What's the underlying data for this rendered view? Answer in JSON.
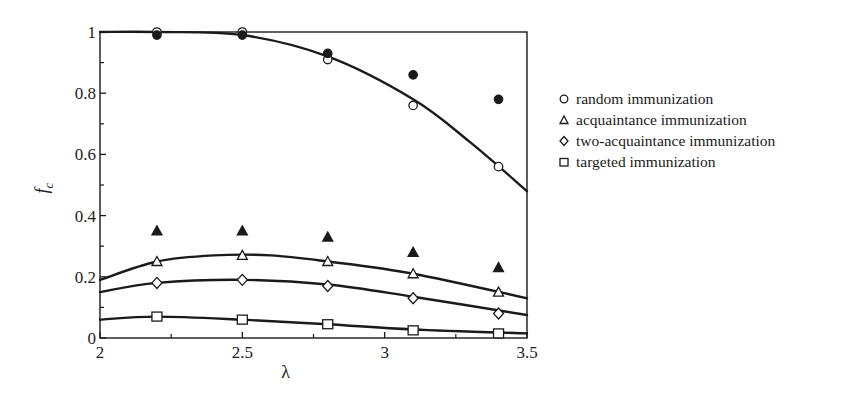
{
  "chart_data": {
    "type": "scatter",
    "title": "",
    "xlabel": "λ",
    "ylabel": "f_c",
    "xlim": [
      2,
      3.5
    ],
    "ylim": [
      0,
      1
    ],
    "x_ticks": [
      2,
      2.5,
      3,
      3.5
    ],
    "x_tick_labels": [
      "2",
      "2.5",
      "3",
      "3.5"
    ],
    "y_ticks": [
      0,
      0.2,
      0.4,
      0.6,
      0.8,
      1
    ],
    "y_tick_labels": [
      "0",
      "0.2",
      "0.4",
      "0.6",
      "0.8",
      "1"
    ],
    "grid": false,
    "legend_position": "right-outside",
    "x": [
      2.2,
      2.5,
      2.8,
      3.1,
      3.4
    ],
    "series": [
      {
        "name": "random immunization",
        "marker": "circle-open",
        "values": [
          1.0,
          1.0,
          0.91,
          0.76,
          0.56
        ],
        "fit_curve": {
          "x": [
            2.0,
            2.2,
            2.5,
            2.8,
            3.1,
            3.3,
            3.5
          ],
          "y": [
            1.0,
            1.0,
            0.99,
            0.92,
            0.78,
            0.64,
            0.48
          ]
        }
      },
      {
        "name": "random immunization (filled)",
        "marker": "circle-filled",
        "values": [
          0.99,
          0.99,
          0.93,
          0.86,
          0.78
        ]
      },
      {
        "name": "acquaintance immunization",
        "marker": "triangle-open",
        "values": [
          0.25,
          0.27,
          0.25,
          0.21,
          0.15
        ],
        "fit_curve": {
          "x": [
            2.0,
            2.2,
            2.4,
            2.6,
            2.8,
            3.1,
            3.5
          ],
          "y": [
            0.19,
            0.25,
            0.27,
            0.27,
            0.25,
            0.21,
            0.13
          ]
        }
      },
      {
        "name": "acquaintance immunization (filled)",
        "marker": "triangle-filled",
        "values": [
          0.35,
          0.35,
          0.33,
          0.28,
          0.23
        ]
      },
      {
        "name": "two-acquaintance immunization",
        "marker": "diamond-open",
        "values": [
          0.18,
          0.19,
          0.17,
          0.13,
          0.08
        ],
        "fit_curve": {
          "x": [
            2.0,
            2.2,
            2.5,
            2.8,
            3.1,
            3.5
          ],
          "y": [
            0.15,
            0.18,
            0.19,
            0.175,
            0.135,
            0.075
          ]
        }
      },
      {
        "name": "targeted immunization",
        "marker": "square-open",
        "values": [
          0.07,
          0.06,
          0.045,
          0.025,
          0.015
        ],
        "fit_curve": {
          "x": [
            2.0,
            2.2,
            2.5,
            2.8,
            3.1,
            3.5
          ],
          "y": [
            0.06,
            0.07,
            0.06,
            0.045,
            0.028,
            0.015
          ]
        }
      }
    ]
  },
  "legend": {
    "items": [
      {
        "label": "random immunization",
        "marker": "circle-open"
      },
      {
        "label": "acquaintance immunization",
        "marker": "triangle-open"
      },
      {
        "label": "two-acquaintance immunization",
        "marker": "diamond-open"
      },
      {
        "label": "targeted immunization",
        "marker": "square-open"
      }
    ]
  },
  "colors": {
    "ink": "#1a1a1a",
    "background": "#ffffff"
  }
}
